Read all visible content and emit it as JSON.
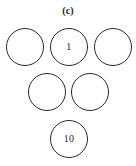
{
  "figure": {
    "caption": "(c)",
    "background_color": "#ffffff",
    "stroke_color": "#2b2b2b",
    "text_color": "#1f1f1f",
    "width": 136,
    "height": 166,
    "layout": "triangular-stack",
    "rows": [
      3,
      2,
      1
    ],
    "nodes": [
      {
        "id": "node-top-left",
        "label": "",
        "x": 6,
        "y": 28,
        "size": 38
      },
      {
        "id": "node-top-center",
        "label": "1",
        "x": 50,
        "y": 28,
        "size": 38
      },
      {
        "id": "node-top-right",
        "label": "",
        "x": 94,
        "y": 28,
        "size": 38
      },
      {
        "id": "node-middle-left",
        "label": "",
        "x": 28,
        "y": 73,
        "size": 38
      },
      {
        "id": "node-middle-right",
        "label": "",
        "x": 71,
        "y": 73,
        "size": 38
      },
      {
        "id": "node-bottom",
        "label": "10",
        "x": 50,
        "y": 120,
        "size": 38
      }
    ]
  }
}
